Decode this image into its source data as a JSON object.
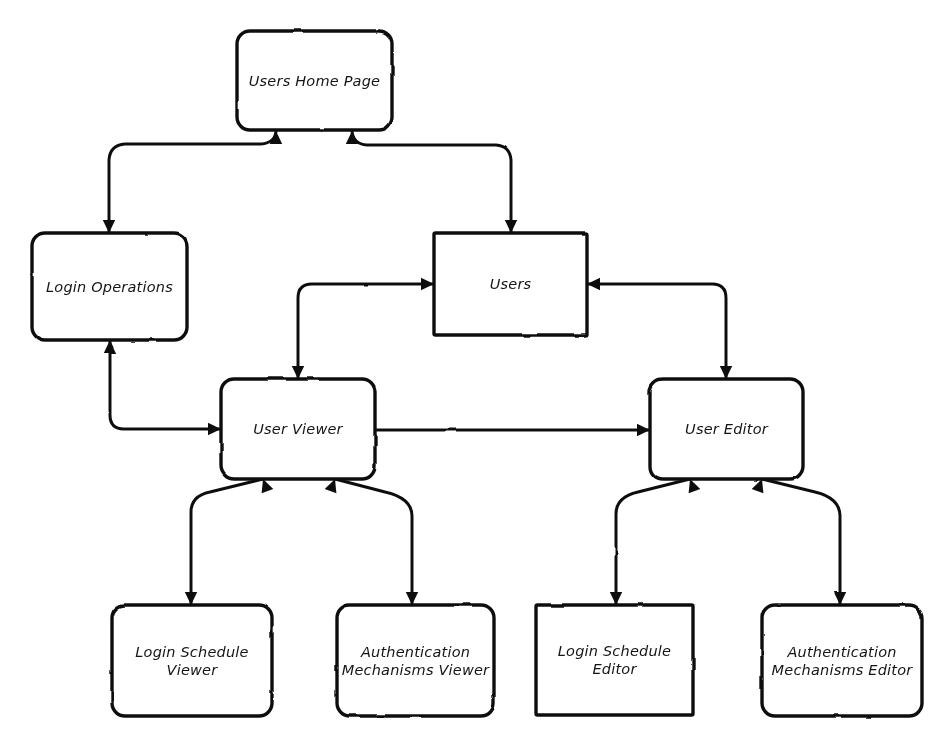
{
  "diagram": {
    "style": {
      "background": "#ffffff",
      "stroke": "#111111",
      "fill": "#ffffff",
      "text": "#151515"
    },
    "nodes": [
      {
        "id": "users-home-page",
        "label": "Users Home Page",
        "lines": [
          "Users Home Page"
        ],
        "x": 237,
        "y": 31,
        "w": 155,
        "h": 99,
        "corner": "rounded"
      },
      {
        "id": "login-operations",
        "label": "Login Operations",
        "lines": [
          "Login Operations"
        ],
        "x": 32,
        "y": 233,
        "w": 155,
        "h": 107,
        "corner": "rounded"
      },
      {
        "id": "users",
        "label": "Users",
        "lines": [
          "Users"
        ],
        "x": 434,
        "y": 233,
        "w": 153,
        "h": 102,
        "corner": "square"
      },
      {
        "id": "user-viewer",
        "label": "User Viewer",
        "lines": [
          "User Viewer"
        ],
        "x": 221,
        "y": 379,
        "w": 154,
        "h": 100,
        "corner": "rounded"
      },
      {
        "id": "user-editor",
        "label": "User Editor",
        "lines": [
          "User Editor"
        ],
        "x": 650,
        "y": 379,
        "w": 153,
        "h": 100,
        "corner": "rounded"
      },
      {
        "id": "login-schedule-viewer",
        "label": "Login Schedule Viewer",
        "lines": [
          "Login Schedule",
          "Viewer"
        ],
        "x": 112,
        "y": 605,
        "w": 160,
        "h": 111,
        "corner": "rounded"
      },
      {
        "id": "authentication-mechanisms-viewer",
        "label": "Authentication Mechanisms Viewer",
        "lines": [
          "Authentication",
          "Mechanisms Viewer"
        ],
        "x": 337,
        "y": 605,
        "w": 157,
        "h": 111,
        "corner": "rounded"
      },
      {
        "id": "login-schedule-editor",
        "label": "Login Schedule Editor",
        "lines": [
          "Login Schedule",
          "Editor"
        ],
        "x": 536,
        "y": 605,
        "w": 157,
        "h": 110,
        "corner": "square"
      },
      {
        "id": "authentication-mechanisms-editor",
        "label": "Authentication Mechanisms Editor",
        "lines": [
          "Authentication",
          "Mechanisms Editor"
        ],
        "x": 762,
        "y": 605,
        "w": 160,
        "h": 111,
        "corner": "rounded"
      }
    ],
    "edges": [
      {
        "id": "edge-home-login-operations",
        "from": "users-home-page",
        "to": "login-operations",
        "direction": "both",
        "path": "M 109 233 L 109 160 Q 110 145 125 144 L 261 144 Q 275 143 276 131",
        "arrow_at_start": true,
        "arrow_at_end": true,
        "start_angle": 90,
        "end_angle": 270
      },
      {
        "id": "edge-home-users",
        "from": "users-home-page",
        "to": "users",
        "direction": "both",
        "path": "M 511 233 L 511 160 Q 510 146 496 145 L 367 145 Q 353 144 352 131",
        "arrow_at_start": true,
        "arrow_at_end": true,
        "start_angle": 90,
        "end_angle": 270
      },
      {
        "id": "edge-users-user-viewer",
        "from": "users",
        "to": "user-viewer",
        "direction": "both",
        "path": "M 434 284 L 312 284 Q 298 284 298 298 L 298 379",
        "arrow_at_start": true,
        "arrow_at_end": true,
        "start_angle": 0,
        "end_angle": 90
      },
      {
        "id": "edge-users-user-editor",
        "from": "users",
        "to": "user-editor",
        "direction": "both",
        "path": "M 587 284 L 712 284 Q 726 284 726 298 L 726 379",
        "arrow_at_start": true,
        "arrow_at_end": true,
        "start_angle": 180,
        "end_angle": 90
      },
      {
        "id": "edge-login-operations-user-viewer",
        "from": "login-operations",
        "to": "user-viewer",
        "direction": "both",
        "path": "M 110 340 L 110 415 Q 110 429 124 429 L 221 429",
        "arrow_at_start": true,
        "arrow_at_end": true,
        "start_angle": 270,
        "end_angle": 0
      },
      {
        "id": "edge-user-viewer-user-editor",
        "from": "user-viewer",
        "to": "user-editor",
        "direction": "forward",
        "path": "M 375 430 L 650 430",
        "arrow_at_start": false,
        "arrow_at_end": true,
        "start_angle": 0,
        "end_angle": 0
      },
      {
        "id": "edge-user-viewer-login-schedule-viewer",
        "from": "user-viewer",
        "to": "login-schedule-viewer",
        "direction": "both",
        "path": "M 263 479 L 210 492 Q 191 496 191 512 L 191 590 Q 191 602 191 605",
        "arrow_at_start": true,
        "arrow_at_end": true,
        "start_angle": 250,
        "end_angle": 90
      },
      {
        "id": "edge-user-viewer-authentication-mechanisms-viewer",
        "from": "user-viewer",
        "to": "authentication-mechanisms-viewer",
        "direction": "both",
        "path": "M 335 479 L 385 492 Q 412 498 412 516 L 412 605",
        "arrow_at_start": true,
        "arrow_at_end": true,
        "start_angle": 290,
        "end_angle": 90
      },
      {
        "id": "edge-user-editor-login-schedule-editor",
        "from": "user-editor",
        "to": "login-schedule-editor",
        "direction": "both",
        "path": "M 690 479 L 638 492 Q 616 497 616 514 L 616 605",
        "arrow_at_start": true,
        "arrow_at_end": true,
        "start_angle": 250,
        "end_angle": 90
      },
      {
        "id": "edge-user-editor-authentication-mechanisms-editor",
        "from": "user-editor",
        "to": "authentication-mechanisms-editor",
        "direction": "both",
        "path": "M 762 479 L 815 492 Q 840 498 840 516 L 840 605",
        "arrow_at_start": true,
        "arrow_at_end": true,
        "start_angle": 290,
        "end_angle": 90
      }
    ]
  }
}
